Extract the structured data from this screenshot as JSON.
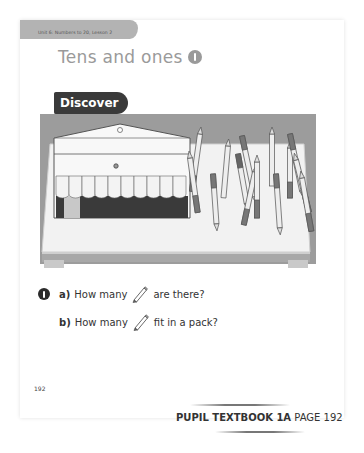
{
  "header": {
    "unit_label": "Unit 6: Numbers to 20, Lesson 2",
    "title": "Tens and ones",
    "lesson_number": "1",
    "section_label": "Discover"
  },
  "illustration": {
    "description": "Open pencil pack with 10 pencils beside loose pencils scattered on a table",
    "pack_capacity_visible": 10
  },
  "questions": [
    {
      "number": "1",
      "letter": "a)",
      "prefix": "How many",
      "icon": "pencil-icon",
      "suffix": "are there?"
    },
    {
      "letter": "b)",
      "prefix": "How many",
      "icon": "pencil-icon",
      "suffix": "fit in a pack?"
    }
  ],
  "page_number": "192",
  "footer": {
    "book": "PUPIL TEXTBOOK 1A",
    "page": "PAGE 192"
  },
  "colors": {
    "tab_gray": "#b3b3b3",
    "title_gray": "#9a9a9a",
    "discover_bg": "#3a3a3a"
  }
}
